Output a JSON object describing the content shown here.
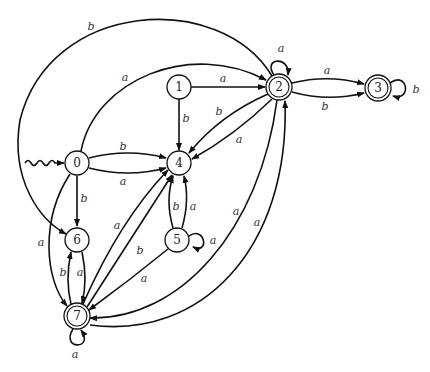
{
  "diagram": {
    "type": "finite-automaton",
    "start_state": "0",
    "states": [
      {
        "id": "0",
        "label": "0",
        "x": 77,
        "y": 163,
        "accepting": false
      },
      {
        "id": "1",
        "label": "1",
        "x": 179,
        "y": 87,
        "accepting": false
      },
      {
        "id": "2",
        "label": "2",
        "x": 279,
        "y": 87,
        "accepting": true
      },
      {
        "id": "3",
        "label": "3",
        "x": 378,
        "y": 88,
        "accepting": true
      },
      {
        "id": "4",
        "label": "4",
        "x": 179,
        "y": 163,
        "accepting": false
      },
      {
        "id": "5",
        "label": "5",
        "x": 177,
        "y": 240,
        "accepting": false
      },
      {
        "id": "6",
        "label": "6",
        "x": 77,
        "y": 240,
        "accepting": false
      },
      {
        "id": "7",
        "label": "7",
        "x": 77,
        "y": 316,
        "accepting": true
      }
    ],
    "transitions": [
      {
        "from": "0",
        "to": "4",
        "label": "b"
      },
      {
        "from": "0",
        "to": "4",
        "label": "a"
      },
      {
        "from": "0",
        "to": "2",
        "label": "a"
      },
      {
        "from": "0",
        "to": "6",
        "label": "b"
      },
      {
        "from": "0",
        "to": "7",
        "label": "a"
      },
      {
        "from": "1",
        "to": "2",
        "label": "a"
      },
      {
        "from": "1",
        "to": "4",
        "label": "b"
      },
      {
        "from": "2",
        "to": "2",
        "label": "a"
      },
      {
        "from": "2",
        "to": "3",
        "label": "a"
      },
      {
        "from": "2",
        "to": "3",
        "label": "b"
      },
      {
        "from": "2",
        "to": "4",
        "label": "b"
      },
      {
        "from": "2",
        "to": "4",
        "label": "a"
      },
      {
        "from": "2",
        "to": "6",
        "label": "b"
      },
      {
        "from": "2",
        "to": "7",
        "label": "a"
      },
      {
        "from": "3",
        "to": "3",
        "label": "b"
      },
      {
        "from": "5",
        "to": "4",
        "label": "a"
      },
      {
        "from": "5",
        "to": "5",
        "label": "a"
      },
      {
        "from": "4",
        "to": "5",
        "label": "b"
      },
      {
        "from": "5",
        "to": "7",
        "label": "a"
      },
      {
        "from": "6",
        "to": "7",
        "label": "a"
      },
      {
        "from": "7",
        "to": "6",
        "label": "b"
      },
      {
        "from": "7",
        "to": "4",
        "label": "a"
      },
      {
        "from": "7",
        "to": "4",
        "label": "b"
      },
      {
        "from": "7",
        "to": "2",
        "label": "a"
      },
      {
        "from": "7",
        "to": "7",
        "label": "a"
      }
    ]
  },
  "labels": {
    "s0": "0",
    "s1": "1",
    "s2": "2",
    "s3": "3",
    "s4": "4",
    "s5": "5",
    "s6": "6",
    "s7": "7",
    "e_0_4_b": "b",
    "e_0_4_a": "a",
    "e_0_2_a": "a",
    "e_0_6_b": "b",
    "e_0_7_a": "a",
    "e_1_2_a": "a",
    "e_1_4_b": "b",
    "e_2_2_a": "a",
    "e_2_3_a": "a",
    "e_2_3_b": "b",
    "e_2_4_b": "b",
    "e_2_4_a": "a",
    "e_2_6_b": "b",
    "e_2_7_a": "a",
    "e_3_3_b": "b",
    "e_5_4_a": "a",
    "e_4_5_b": "b",
    "e_5_5_a": "a",
    "e_5_7_a": "a",
    "e_6_7_a": "a",
    "e_7_6_b": "b",
    "e_7_4_a": "a",
    "e_7_4_b": "b",
    "e_7_2_a": "a",
    "e_7_7_a": "a"
  }
}
